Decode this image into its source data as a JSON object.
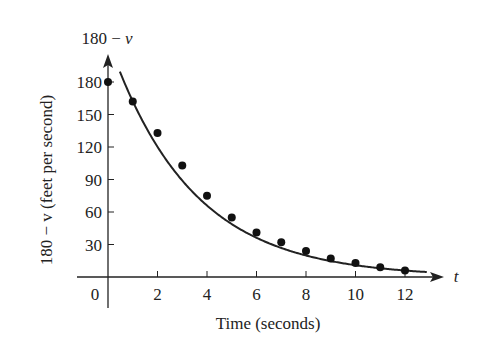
{
  "chart_data": {
    "type": "scatter",
    "title": "",
    "xlabel": "Time (seconds)",
    "ylabel": "180 − v (feet per second)",
    "y_axis_top_label": "180 − v",
    "x_axis_end_label": "t",
    "xlim": [
      0,
      13.5
    ],
    "ylim": [
      0,
      200
    ],
    "x_ticks": [
      0,
      2,
      4,
      6,
      8,
      10,
      12
    ],
    "y_ticks": [
      30,
      60,
      90,
      120,
      150,
      180
    ],
    "grid": false,
    "legend": null,
    "series": [
      {
        "name": "data points",
        "kind": "scatter",
        "x": [
          0,
          1,
          2,
          3,
          4,
          5,
          6,
          7,
          8,
          9,
          10,
          11,
          12
        ],
        "values": [
          180,
          162,
          133,
          103,
          75,
          55,
          41,
          32,
          24,
          17,
          13,
          9,
          6
        ]
      },
      {
        "name": "exponential fit",
        "kind": "line",
        "model": "y = 219 e^(-0.3 t)",
        "x": [
          0.5,
          1,
          2,
          3,
          4,
          5,
          6,
          7,
          8,
          9,
          10,
          11,
          12,
          13
        ],
        "values": [
          188,
          162,
          120,
          89,
          66,
          49,
          36,
          27,
          20,
          15,
          11,
          8,
          6,
          4
        ]
      }
    ],
    "colors": {
      "axis": "#222222",
      "points": "#111111",
      "curve": "#222222"
    }
  },
  "labels": {
    "origin": "0",
    "x_title": "Time (seconds)",
    "y_title": "180 − v (feet per second)",
    "y_top_num": "180 − ",
    "y_top_var": "v",
    "x_end": "t"
  }
}
